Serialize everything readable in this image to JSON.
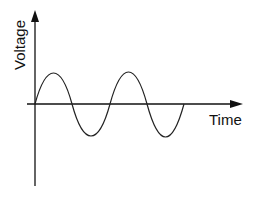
{
  "diagram": {
    "y_axis_label": "Voltage",
    "x_axis_label": "Time",
    "waveform": "sine",
    "cycles": 2,
    "colors": {
      "axis": "#111111",
      "wave": "#222222",
      "background": "#ffffff"
    }
  }
}
